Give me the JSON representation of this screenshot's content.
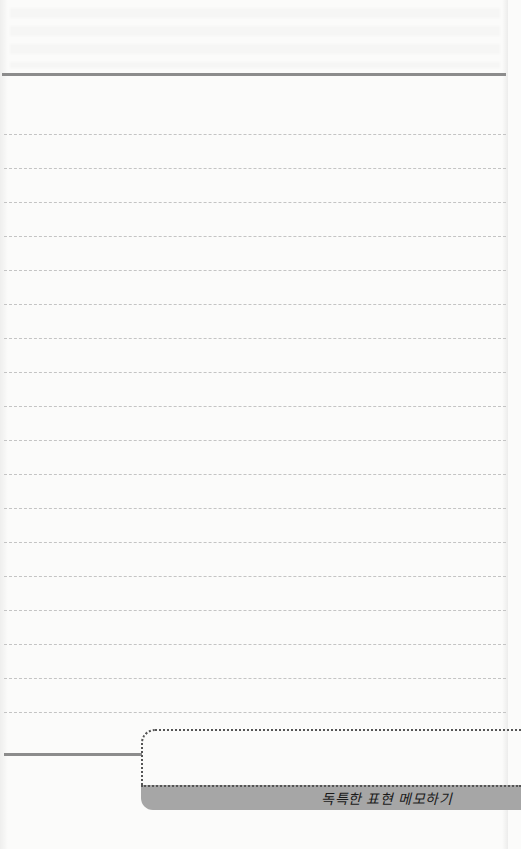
{
  "page": {
    "type": "lined-notepad",
    "background_color": "#fbfbfa",
    "rule_color": "#8c8c8c",
    "line_color": "#c4c4c4"
  },
  "ruled_lines": {
    "count": 18,
    "first_y": 134,
    "spacing": 34
  },
  "memo_section": {
    "label": "독특한 표현 메모하기",
    "band_color": "#a6a6a6"
  }
}
